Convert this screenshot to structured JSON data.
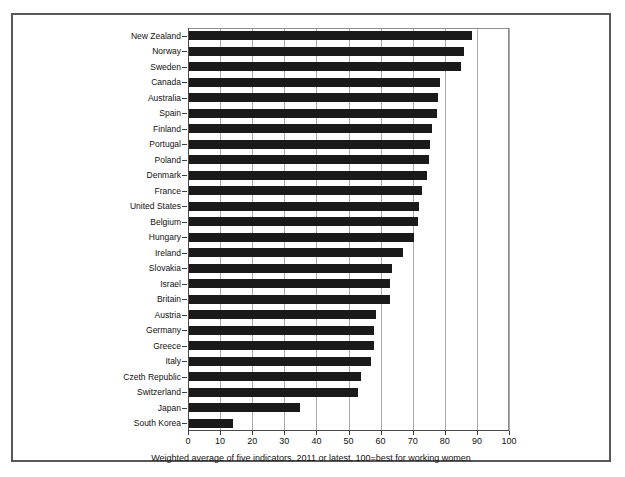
{
  "chart_data": {
    "type": "bar",
    "orientation": "horizontal",
    "title": "",
    "subtitle": "",
    "xlabel": "",
    "ylabel": "",
    "caption": "Weighted average of five indicators, 2011 or latest, 100=best for working women",
    "xlim": [
      0,
      100
    ],
    "xticks": [
      0,
      10,
      20,
      30,
      40,
      50,
      60,
      70,
      80,
      90,
      100
    ],
    "xtick_labels": [
      "0",
      "10",
      "20",
      "30",
      "40",
      "50",
      "60",
      "70",
      "80",
      "90",
      "100"
    ],
    "grid": true,
    "grid_axis": "x",
    "legend": false,
    "bar_color": "#1a1a1a",
    "categories": [
      "New Zealand",
      "Norway",
      "Sweden",
      "Canada",
      "Australia",
      "Spain",
      "Finland",
      "Portugal",
      "Poland",
      "Denmark",
      "France",
      "United States",
      "Belgium",
      "Hungary",
      "Ireland",
      "Slovakia",
      "Israel",
      "Britain",
      "Austria",
      "Germany",
      "Greece",
      "Italy",
      "Czeth Republic",
      "Switzerland",
      "Japan",
      "South Korea"
    ],
    "values": [
      88.5,
      86.0,
      85.0,
      78.5,
      78.0,
      77.5,
      76.0,
      75.5,
      75.0,
      74.5,
      73.0,
      72.0,
      71.5,
      70.5,
      67.0,
      63.5,
      63.0,
      63.0,
      58.5,
      58.0,
      58.0,
      57.0,
      54.0,
      53.0,
      35.0,
      14.0
    ]
  }
}
